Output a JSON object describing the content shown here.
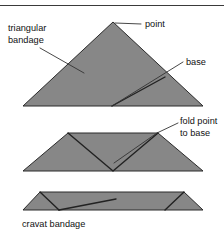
{
  "figure": {
    "colors": {
      "fabric_fill": "#878787",
      "outline": "#2b2b2b",
      "fold_line": "#222222",
      "leader_line": "#333333",
      "text": "#111111",
      "background": "#ffffff",
      "top_rule": "#3a3a3a"
    },
    "labels": {
      "triangular_bandage_line1": "triangular",
      "triangular_bandage_line2": "bandage",
      "point": "point",
      "base": "base",
      "fold_point_line1": "fold point",
      "fold_point_line2": "to base",
      "cravat_bandage": "cravat bandage"
    },
    "stages": [
      {
        "name": "open-triangular-bandage",
        "description": "Unfolded triangular bandage showing point and base"
      },
      {
        "name": "point-folded-to-base",
        "description": "Bandage with point folded down to the base forming a trapezoid"
      },
      {
        "name": "cravat-bandage",
        "description": "Fully folded narrow cravat bandage"
      }
    ]
  }
}
